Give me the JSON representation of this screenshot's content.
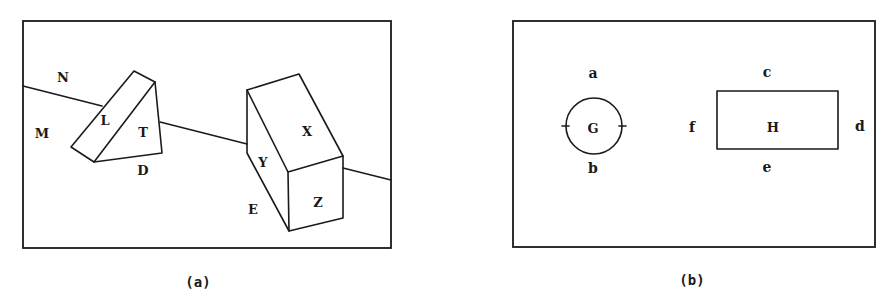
{
  "panel_a": {
    "caption": "(a)",
    "labels": {
      "N": "N",
      "M": "M",
      "L": "L",
      "T": "T",
      "D": "D",
      "X": "X",
      "Y": "Y",
      "Z": "Z",
      "E": "E"
    }
  },
  "panel_b": {
    "caption": "(b)",
    "labels": {
      "a": "a",
      "b": "b",
      "c": "c",
      "d": "d",
      "e": "e",
      "f": "f",
      "G": "G",
      "H": "H"
    }
  }
}
